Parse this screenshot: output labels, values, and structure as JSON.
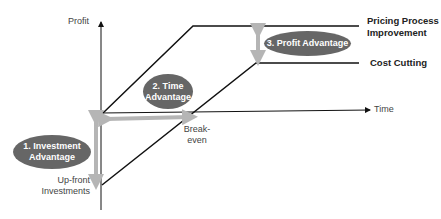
{
  "axes": {
    "y_label": "Profit",
    "x_label": "Time"
  },
  "lines": [
    {
      "label_line1": "Pricing Process",
      "label_line2": "Improvement"
    },
    {
      "label": "Cost Cutting"
    }
  ],
  "annotations": {
    "breakeven_line1": "Break-",
    "breakeven_line2": "even",
    "upfront_line1": "Up-front",
    "upfront_line2": "Investments"
  },
  "callouts": [
    {
      "line1": "1. Investment",
      "line2": "Advantage"
    },
    {
      "line1": "2. Time",
      "line2": "Advantage"
    },
    {
      "line1": "3. Profit Advantage"
    }
  ],
  "colors": {
    "line": "#111111",
    "arrow": "#b5b5b5",
    "callout": "#666666"
  }
}
